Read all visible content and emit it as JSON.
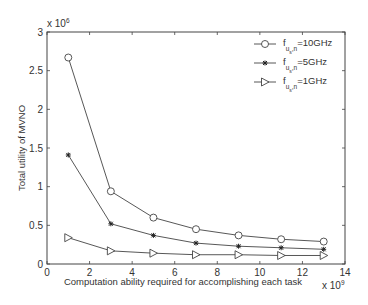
{
  "chart_data": {
    "type": "line",
    "title": "",
    "xlabel": "Computation ability required for accomplishing each task",
    "ylabel": "Total utility of MVNO",
    "x_multiplier": "x 10^9",
    "y_multiplier": "x 10^6",
    "xlim": [
      0,
      14
    ],
    "ylim": [
      0,
      3
    ],
    "xticks": [
      0,
      2,
      4,
      6,
      8,
      10,
      12,
      14
    ],
    "yticks": [
      0,
      0.5,
      1,
      1.5,
      2,
      2.5,
      3
    ],
    "grid": false,
    "legend_position": "upper right",
    "x": [
      1,
      3,
      5,
      7,
      9,
      11,
      13
    ],
    "series": [
      {
        "name": "f_{u_s,n}=10GHz",
        "marker": "circle",
        "values": [
          2.67,
          0.94,
          0.6,
          0.45,
          0.37,
          0.32,
          0.29
        ]
      },
      {
        "name": "f_{u_s,n}=5GHz",
        "marker": "star",
        "values": [
          1.41,
          0.52,
          0.37,
          0.27,
          0.23,
          0.21,
          0.19
        ]
      },
      {
        "name": "f_{u_s,n}=1GHz",
        "marker": "triangle-right",
        "values": [
          0.34,
          0.17,
          0.14,
          0.12,
          0.12,
          0.11,
          0.11
        ]
      }
    ]
  },
  "legend": {
    "items": [
      {
        "base": "f",
        "sub": "u",
        "subsub": "s",
        "tail": ",n",
        "value": "=10GHz"
      },
      {
        "base": "f",
        "sub": "u",
        "subsub": "s",
        "tail": ",n",
        "value": "=5GHz"
      },
      {
        "base": "f",
        "sub": "u",
        "subsub": "s",
        "tail": ",n",
        "value": "=1GHz"
      }
    ]
  },
  "axes": {
    "xlabel": "Computation ability required for accomplishing each task",
    "ylabel": "Total utility of MVNO",
    "x_exp_base": "x 10",
    "x_exp": "9",
    "y_exp_base": "x 10",
    "y_exp": "6"
  }
}
